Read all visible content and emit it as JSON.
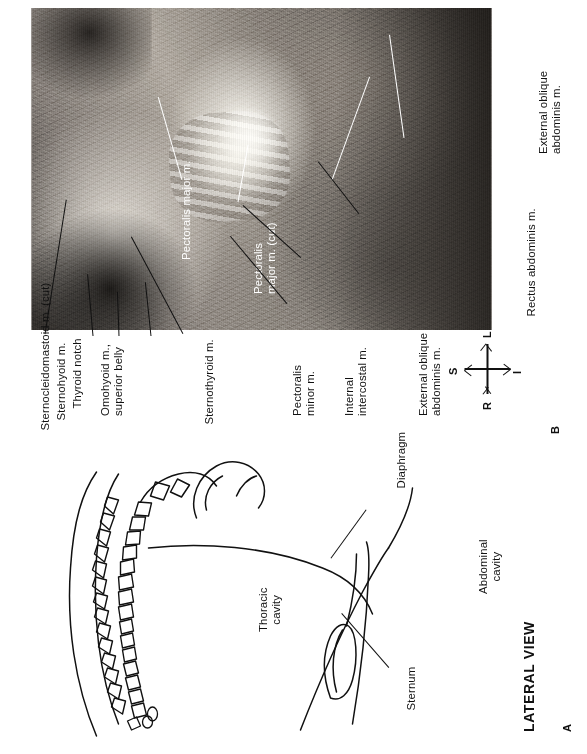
{
  "figure": {
    "panel_a": {
      "marker": "A",
      "view_title": "LATERAL VIEW",
      "labels": [
        {
          "id": "sternum",
          "text": "Sternum"
        },
        {
          "id": "thoracic-cavity",
          "text": "Thoracic\ncavity"
        },
        {
          "id": "diaphragm",
          "text": "Diaphragm"
        },
        {
          "id": "abdominal-cavity",
          "text": "Abdominal\ncavity"
        }
      ]
    },
    "panel_b": {
      "marker": "B",
      "labels_left": [
        {
          "id": "sternocleidomastoid",
          "text": "Sternocleidomastoid m. (cut)"
        },
        {
          "id": "sternohyoid",
          "text": "Sternohyoid m."
        },
        {
          "id": "thyroid-notch",
          "text": "Thyroid notch"
        },
        {
          "id": "omohyoid",
          "text": "Omohyoid m.,\nsuperior belly"
        },
        {
          "id": "sternothyroid",
          "text": "Sternothyroid m."
        },
        {
          "id": "pectoralis-minor",
          "text": "Pectoralis\nminor m."
        },
        {
          "id": "internal-intercostal",
          "text": "Internal\nintercostal m."
        },
        {
          "id": "external-oblique-left",
          "text": "External oblique\nabdominis m."
        }
      ],
      "labels_on_photo": [
        {
          "id": "pectoralis-major",
          "text": "Pectoralis major m."
        },
        {
          "id": "pectoralis-major-cut",
          "text": "Pectoralis\nmajor m. (cut)"
        }
      ],
      "labels_right": [
        {
          "id": "external-oblique-right",
          "text": "External oblique\nabdominis m."
        },
        {
          "id": "rectus-abdominis",
          "text": "Rectus abdominis m."
        }
      ],
      "orientation": {
        "superior": "S",
        "inferior": "I",
        "left": "L",
        "right": "R"
      }
    }
  },
  "colors": {
    "ink": "#111111",
    "paper": "#ffffff",
    "callout_white": "#ffffff"
  }
}
